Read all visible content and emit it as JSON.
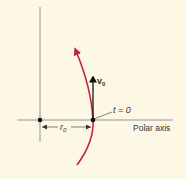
{
  "diagram": {
    "type": "polar-trajectory",
    "background_color": "#fdf8e6",
    "curve_color": "#c0283a",
    "line_color": "#555555",
    "labels": {
      "velocity_symbol": "v",
      "velocity_subscript": "0",
      "time_label": "t = 0",
      "radius_symbol": "r",
      "radius_subscript": "0",
      "axis_label": "Polar axis"
    }
  }
}
